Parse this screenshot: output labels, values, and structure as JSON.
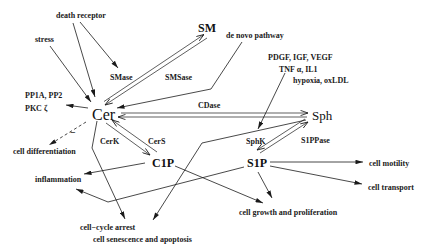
{
  "diagram": {
    "nodes": {
      "sm": "SM",
      "cer": "Cer",
      "sph": "Sph",
      "c1p": "C1P",
      "s1p": "S1P"
    },
    "enzymes": {
      "smase": "SMase",
      "smsase": "SMSase",
      "cdase": "CDase",
      "cerk": "CerK",
      "cers": "CerS",
      "sphk": "SphK",
      "s1ppase": "S1PPase"
    },
    "inputs": {
      "death_receptor": "death receptor",
      "stress": "stress",
      "de_novo": "de novo pathway",
      "growth_factors_line1": "PDGF, IGF, VEGF",
      "growth_factors_line2": "TNF α,  IL1",
      "growth_factors_line3": "hypoxia, oxLDL",
      "phosphatases": "PP1A, PP2",
      "pkc": "PKC ζ"
    },
    "outcomes": {
      "cell_differentiation": "cell differentiation",
      "inflammation": "inflammation",
      "cell_cycle_arrest": "cell−cycle arrest",
      "senescence_apoptosis": "cell senescence and apoptosis",
      "growth_proliferation": "cell growth and proliferation",
      "cell_motility": "cell motility",
      "cell_transport": "cell transport"
    },
    "annotations": {
      "inhibition_sign": "−"
    },
    "edges": [
      {
        "from": "death receptor",
        "to": "SMase",
        "type": "activation"
      },
      {
        "from": "death receptor",
        "to": "Cer",
        "type": "activation"
      },
      {
        "from": "stress",
        "to": "Cer",
        "type": "activation"
      },
      {
        "from": "SM",
        "to": "Cer",
        "enzyme": "SMase",
        "type": "conversion"
      },
      {
        "from": "Cer",
        "to": "SM",
        "enzyme": "SMSase",
        "type": "conversion"
      },
      {
        "from": "de novo pathway",
        "to": "Cer",
        "type": "activation"
      },
      {
        "from": "Cer",
        "to": "PKC ζ",
        "type": "activation"
      },
      {
        "from": "Cer",
        "to": "cell differentiation",
        "type": "inhibition",
        "style": "dashed"
      },
      {
        "from": "Cer",
        "to": "Sph",
        "enzyme": "CDase",
        "type": "conversion"
      },
      {
        "from": "Sph",
        "to": "Cer",
        "type": "conversion"
      },
      {
        "from": "Cer",
        "to": "C1P",
        "enzyme": "CerK",
        "type": "conversion"
      },
      {
        "from": "C1P",
        "to": "Cer",
        "enzyme": "CerS",
        "type": "conversion"
      },
      {
        "from": "Cer",
        "to": "cell-cycle arrest",
        "type": "activation"
      },
      {
        "from": "C1P",
        "to": "inflammation",
        "type": "activation"
      },
      {
        "from": "C1P",
        "to": "cell growth and proliferation",
        "type": "activation"
      },
      {
        "from": "Sph",
        "to": "cell senescence and apoptosis",
        "type": "activation"
      },
      {
        "from": "growth factors",
        "to": "SphK",
        "type": "activation"
      },
      {
        "from": "Sph",
        "to": "S1P",
        "enzyme": "SphK",
        "type": "conversion"
      },
      {
        "from": "S1P",
        "to": "Sph",
        "enzyme": "S1PPase",
        "type": "conversion"
      },
      {
        "from": "S1P",
        "to": "inflammation",
        "type": "activation"
      },
      {
        "from": "S1P",
        "to": "cell growth and proliferation",
        "type": "activation"
      },
      {
        "from": "S1P",
        "to": "cell motility",
        "type": "activation"
      },
      {
        "from": "S1P",
        "to": "cell transport",
        "type": "activation"
      }
    ]
  }
}
